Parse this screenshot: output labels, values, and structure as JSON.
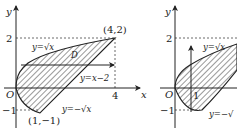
{
  "figures": [
    {
      "id": "left",
      "axis_x_label": "x",
      "axis_y_label": "y",
      "origin_label": "O",
      "tick_x": "4",
      "tick_y_pos": "2",
      "tick_y_neg": "−1",
      "point_top": "(4,2)",
      "point_bottom": "(1,−1)",
      "curve_upper_label": "y=√x",
      "curve_lower_label": "y=−√x",
      "line_label": "y=x−2",
      "region_label": "D",
      "arrow_direction": "horizontal"
    },
    {
      "id": "right",
      "axis_y_label": "y",
      "origin_label": "O",
      "tick_x": "1",
      "tick_y_pos": "2",
      "tick_y_neg": "−1",
      "curve_upper_label": "y=√x",
      "curve_lower_label": "y=−√",
      "arrow_direction": "vertical"
    }
  ],
  "colors": {
    "stroke": "#222222",
    "hatch": "#333333",
    "dashed": "#444444"
  }
}
